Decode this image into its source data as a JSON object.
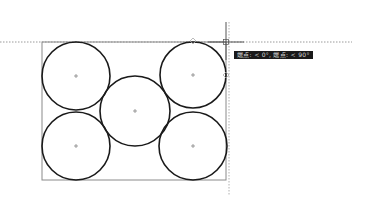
{
  "drawing": {
    "rectangle": {
      "x": 42,
      "y": 42,
      "width": 184,
      "height": 138
    },
    "circles": [
      {
        "name": "top-left",
        "cx": 76,
        "cy": 76,
        "r": 34
      },
      {
        "name": "bottom-left",
        "cx": 76,
        "cy": 146,
        "r": 34
      },
      {
        "name": "middle",
        "cx": 135,
        "cy": 111,
        "r": 35
      },
      {
        "name": "top-right",
        "cx": 193,
        "cy": 75,
        "r": 33
      },
      {
        "name": "bottom-right",
        "cx": 193,
        "cy": 146,
        "r": 34
      }
    ],
    "stroke_color": "#1a1a1a",
    "rect_stroke_color": "#8a8a8a"
  },
  "cursor": {
    "x": 226,
    "y": 42
  },
  "tracking": {
    "horizontal_line": {
      "y": 42,
      "x1": 0,
      "x2": 352
    },
    "vertical_line": {
      "x": 229,
      "y1": 22,
      "y2": 195
    }
  },
  "snap_markers": [
    {
      "x": 193,
      "y": 41
    },
    {
      "x": 226,
      "y": 75
    }
  ],
  "tooltip": {
    "text": "端点: < 0°, 端点: < 90°"
  }
}
